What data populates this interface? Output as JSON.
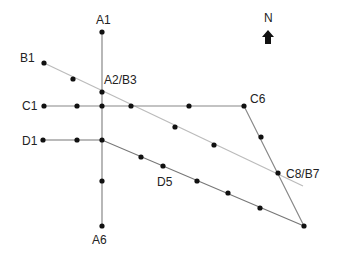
{
  "north_arrow": {
    "label": "N",
    "x": 268,
    "y": 22
  },
  "lines": {
    "A": {
      "color": "#888888",
      "width": 1.2,
      "points": [
        [
          102,
          32
        ],
        [
          102,
          226
        ]
      ]
    },
    "B": {
      "color": "#bbbbbb",
      "width": 1.2,
      "points": [
        [
          44,
          63
        ],
        [
          303,
          186
        ]
      ]
    },
    "C": {
      "color": "#888888",
      "width": 1.2,
      "points": [
        [
          44,
          106
        ],
        [
          244,
          106
        ],
        [
          304,
          226
        ]
      ]
    },
    "D": {
      "color": "#777777",
      "width": 1.2,
      "points": [
        [
          43,
          140
        ],
        [
          102,
          140
        ],
        [
          304,
          226
        ]
      ]
    }
  },
  "dots": [
    [
      102,
      32
    ],
    [
      44,
      63
    ],
    [
      73,
      79
    ],
    [
      102,
      92
    ],
    [
      175,
      127
    ],
    [
      214,
      145
    ],
    [
      278,
      173
    ],
    [
      44,
      106
    ],
    [
      77,
      106
    ],
    [
      102,
      106
    ],
    [
      131,
      106
    ],
    [
      189,
      106
    ],
    [
      244,
      106
    ],
    [
      261,
      137
    ],
    [
      43,
      140
    ],
    [
      77,
      140
    ],
    [
      102,
      140
    ],
    [
      141,
      157
    ],
    [
      163,
      166
    ],
    [
      197,
      181
    ],
    [
      228,
      193
    ],
    [
      260,
      208
    ],
    [
      304,
      226
    ],
    [
      102,
      181
    ],
    [
      102,
      226
    ]
  ],
  "labels": [
    {
      "text": "A1",
      "x": 96,
      "y": 24
    },
    {
      "text": "B1",
      "x": 20,
      "y": 62
    },
    {
      "text": "A2/B3",
      "x": 104,
      "y": 84
    },
    {
      "text": "C1",
      "x": 22,
      "y": 110
    },
    {
      "text": "C6",
      "x": 250,
      "y": 103
    },
    {
      "text": "D1",
      "x": 22,
      "y": 145
    },
    {
      "text": "D5",
      "x": 157,
      "y": 186
    },
    {
      "text": "C8/B7",
      "x": 286,
      "y": 178
    },
    {
      "text": "A6",
      "x": 92,
      "y": 244
    }
  ]
}
